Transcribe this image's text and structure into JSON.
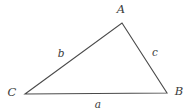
{
  "figure": {
    "type": "geometry-diagram",
    "shape": "triangle",
    "background_color": "#ffffff",
    "stroke_color": "#4a4a4a",
    "text_color": "#3b3b3b",
    "stroke_width": 1.1
  },
  "vertices": [
    {
      "id": "A",
      "label": "A",
      "x": 122,
      "y": 23,
      "label_x": 121,
      "label_y": 10
    },
    {
      "id": "B",
      "label": "B",
      "x": 167,
      "y": 93,
      "label_x": 179,
      "label_y": 92
    },
    {
      "id": "C",
      "label": "C",
      "x": 25,
      "y": 94,
      "label_x": 12,
      "label_y": 93
    }
  ],
  "sides": [
    {
      "id": "a",
      "label": "a",
      "from": "C",
      "to": "B",
      "label_x": 98,
      "label_y": 104
    },
    {
      "id": "b",
      "label": "b",
      "from": "C",
      "to": "A",
      "label_x": 61,
      "label_y": 53
    },
    {
      "id": "c",
      "label": "c",
      "from": "A",
      "to": "B",
      "label_x": 155,
      "label_y": 52
    }
  ],
  "polygon_points": "122,23 167,93 25,94"
}
